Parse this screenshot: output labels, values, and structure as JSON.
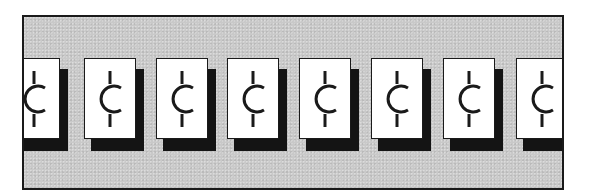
{
  "scene": {
    "description": "Row of cent-sign cards with drop shadows inside a gray framed strip",
    "frame": {
      "background_color": "#c9c9c9",
      "border_color": "#1a1a1a"
    },
    "card_style": {
      "face_color": "#ffffff",
      "shadow_color": "#141414",
      "glyph_color": "#1a1a1a"
    },
    "cards": [
      {
        "symbol": "¢",
        "icon": "cent-icon",
        "left": -16
      },
      {
        "symbol": "¢",
        "icon": "cent-icon",
        "left": 60
      },
      {
        "symbol": "¢",
        "icon": "cent-icon",
        "left": 132
      },
      {
        "symbol": "¢",
        "icon": "cent-icon",
        "left": 203
      },
      {
        "symbol": "¢",
        "icon": "cent-icon",
        "left": 275
      },
      {
        "symbol": "¢",
        "icon": "cent-icon",
        "left": 347
      },
      {
        "symbol": "¢",
        "icon": "cent-icon",
        "left": 419
      },
      {
        "symbol": "¢",
        "icon": "cent-icon",
        "left": 492
      }
    ]
  }
}
